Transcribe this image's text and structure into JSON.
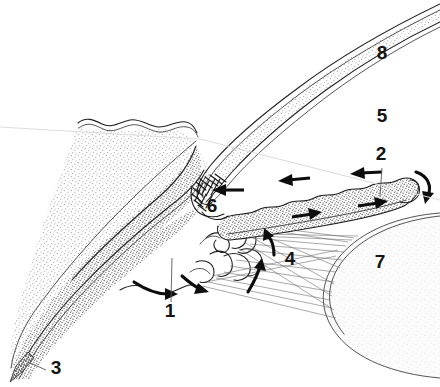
{
  "figure": {
    "background_color": "#ffffff",
    "width": 440,
    "height": 387,
    "ink_color": "#1d1d1d",
    "leader_color": "#5a5a5a",
    "arrow_color": "#0d0d0d"
  },
  "labels": [
    {
      "id": "label-1",
      "text": "1",
      "x": 170,
      "y": 317,
      "leader": "vertical line running up from the numeral into the ciliary body region"
    },
    {
      "id": "label-2",
      "text": "2",
      "x": 381,
      "y": 160,
      "leader": "short vertical line running down to the iris stroma"
    },
    {
      "id": "label-3",
      "text": "3",
      "x": 56,
      "y": 374,
      "leader": "short horizontal line running left to the tip of the sclera"
    },
    {
      "id": "label-4",
      "text": "4",
      "x": 290,
      "y": 265,
      "leader": "none"
    },
    {
      "id": "label-5",
      "text": "5",
      "x": 382,
      "y": 122,
      "leader": "none"
    },
    {
      "id": "label-6",
      "text": "6",
      "x": 212,
      "y": 212,
      "leader": "none"
    },
    {
      "id": "label-7",
      "text": "7",
      "x": 380,
      "y": 268,
      "leader": "none"
    },
    {
      "id": "label-8",
      "text": "8",
      "x": 382,
      "y": 59,
      "leader": "none"
    }
  ],
  "regions": [
    {
      "name": "cornea",
      "shade": "light-stipple",
      "fill": "#e9e9e9",
      "label_ref": "8"
    },
    {
      "name": "anterior-chamber",
      "shade": "white",
      "fill": "#ffffff",
      "label_ref": "5"
    },
    {
      "name": "sclera",
      "shade": "light-stipple",
      "fill": "#e6e6e6",
      "label_ref": "3"
    },
    {
      "name": "ciliary-body",
      "shade": "dark-stipple",
      "fill": "#9a9a9a",
      "label_ref": "1"
    },
    {
      "name": "iris",
      "shade": "dark-stipple",
      "fill": "#9a9a9a",
      "label_ref": "2"
    },
    {
      "name": "lens",
      "shade": "very-light",
      "fill": "#ececec",
      "label_ref": "7"
    },
    {
      "name": "zonular-fibres",
      "shade": "hairlines",
      "fill": "none",
      "label_ref": "4"
    },
    {
      "name": "trabecular-meshwork",
      "shade": "cross-hatch",
      "fill": "none",
      "label_ref": "6"
    }
  ],
  "flow_arrows": [
    {
      "name": "arrow-posterior-chamber-secretion-left",
      "direction": "left-down",
      "description": "secretion from ciliary body"
    },
    {
      "name": "arrow-posterior-chamber-secretion-right",
      "direction": "right-down",
      "description": "secretion from ciliary body"
    },
    {
      "name": "arrow-zonule-up",
      "direction": "up",
      "description": "flow up through zonules"
    },
    {
      "name": "arrow-zonule-curve",
      "direction": "up-left",
      "description": "flow around lens equator"
    },
    {
      "name": "arrow-through-pupil",
      "direction": "around",
      "description": "aqueous passing through the pupil"
    },
    {
      "name": "arrow-posterior-iris-right-1",
      "direction": "right",
      "description": "posterior-chamber flow toward pupil"
    },
    {
      "name": "arrow-posterior-iris-right-2",
      "direction": "right",
      "description": "posterior-chamber flow toward pupil"
    },
    {
      "name": "arrow-anterior-chamber-left-1",
      "direction": "left",
      "description": "anterior-chamber flow toward the angle"
    },
    {
      "name": "arrow-anterior-chamber-left-2",
      "direction": "left",
      "description": "anterior-chamber flow toward the angle"
    },
    {
      "name": "arrow-into-trabecular-meshwork",
      "direction": "left",
      "description": "drainage into the trabecular meshwork"
    }
  ]
}
